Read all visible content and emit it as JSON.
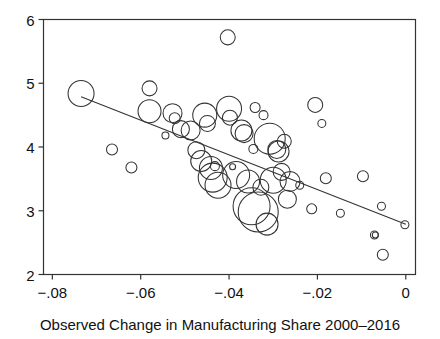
{
  "chart_data": {
    "type": "scatter",
    "title": "",
    "subtitle": "",
    "xlabel": "Observed Change in Manufacturing Share 2000–2016",
    "ylabel": "",
    "xlim": [
      -0.082,
      0.0022
    ],
    "ylim": [
      2.0,
      6.0
    ],
    "grid": false,
    "legend": "none",
    "marker_style": "open-circle-bubble",
    "marker_fill": "none",
    "marker_stroke": "#333333",
    "axis_color": "#333333",
    "background": "#ffffff",
    "xticks": [
      -0.08,
      -0.06,
      -0.04,
      -0.02,
      0
    ],
    "xticklabels": [
      "−.08",
      "−.06",
      "−.04",
      "−.02",
      "0"
    ],
    "yticks": [
      2,
      3,
      4,
      5,
      6
    ],
    "yticklabels": [
      "2",
      "3",
      "4",
      "5",
      "6"
    ],
    "size_encoding": "bubble area proportional to weight",
    "fit_line": {
      "type": "linear",
      "x_start": -0.0735,
      "y_start": 4.79,
      "x_end": 0.0,
      "y_end": 2.79,
      "slope": -27.21,
      "intercept": 2.79,
      "color": "#333333"
    },
    "points": [
      {
        "x": -0.0735,
        "y": 4.84,
        "size": 13.0
      },
      {
        "x": -0.0665,
        "y": 3.96,
        "size": 5.5
      },
      {
        "x": -0.0621,
        "y": 3.68,
        "size": 5.5
      },
      {
        "x": -0.058,
        "y": 4.92,
        "size": 7.5
      },
      {
        "x": -0.058,
        "y": 4.56,
        "size": 11.5
      },
      {
        "x": -0.0544,
        "y": 4.18,
        "size": 3.5
      },
      {
        "x": -0.0528,
        "y": 4.53,
        "size": 9.5
      },
      {
        "x": -0.0523,
        "y": 4.45,
        "size": 5.5
      },
      {
        "x": -0.0509,
        "y": 4.28,
        "size": 8.5
      },
      {
        "x": -0.0487,
        "y": 4.26,
        "size": 9.5
      },
      {
        "x": -0.0474,
        "y": 3.95,
        "size": 8.5
      },
      {
        "x": -0.0463,
        "y": 3.78,
        "size": 10.5
      },
      {
        "x": -0.0455,
        "y": 4.5,
        "size": 12.0
      },
      {
        "x": -0.0449,
        "y": 4.37,
        "size": 8.0
      },
      {
        "x": -0.0441,
        "y": 3.67,
        "size": 11.5
      },
      {
        "x": -0.0437,
        "y": 3.52,
        "size": 14.5
      },
      {
        "x": -0.0432,
        "y": 3.7,
        "size": 4.5
      },
      {
        "x": -0.0425,
        "y": 3.4,
        "size": 13.0
      },
      {
        "x": -0.0403,
        "y": 5.72,
        "size": 7.5
      },
      {
        "x": -0.04,
        "y": 4.6,
        "size": 12.5
      },
      {
        "x": -0.0398,
        "y": 4.46,
        "size": 7.5
      },
      {
        "x": -0.0392,
        "y": 3.69,
        "size": 3.0
      },
      {
        "x": -0.0384,
        "y": 3.56,
        "size": 13.5
      },
      {
        "x": -0.0372,
        "y": 4.26,
        "size": 10.5
      },
      {
        "x": -0.0366,
        "y": 4.21,
        "size": 9.0
      },
      {
        "x": -0.0357,
        "y": 3.46,
        "size": 11.5
      },
      {
        "x": -0.0349,
        "y": 3.07,
        "size": 18.5
      },
      {
        "x": -0.0345,
        "y": 3.97,
        "size": 4.5
      },
      {
        "x": -0.0341,
        "y": 4.62,
        "size": 5.0
      },
      {
        "x": -0.0334,
        "y": 2.98,
        "size": 20.0
      },
      {
        "x": -0.0328,
        "y": 3.37,
        "size": 8.0
      },
      {
        "x": -0.0322,
        "y": 4.5,
        "size": 4.5
      },
      {
        "x": -0.0314,
        "y": 2.79,
        "size": 11.0
      },
      {
        "x": -0.0308,
        "y": 4.13,
        "size": 15.5
      },
      {
        "x": -0.03,
        "y": 3.48,
        "size": 13.0
      },
      {
        "x": -0.0292,
        "y": 3.96,
        "size": 9.0
      },
      {
        "x": -0.0288,
        "y": 3.93,
        "size": 10.5
      },
      {
        "x": -0.0281,
        "y": 3.61,
        "size": 8.5
      },
      {
        "x": -0.0275,
        "y": 4.09,
        "size": 7.0
      },
      {
        "x": -0.0268,
        "y": 3.18,
        "size": 9.0
      },
      {
        "x": -0.0262,
        "y": 3.46,
        "size": 10.0
      },
      {
        "x": -0.024,
        "y": 3.4,
        "size": 4.0
      },
      {
        "x": -0.0213,
        "y": 3.03,
        "size": 5.0
      },
      {
        "x": -0.0205,
        "y": 4.66,
        "size": 7.5
      },
      {
        "x": -0.019,
        "y": 4.37,
        "size": 4.0
      },
      {
        "x": -0.0181,
        "y": 3.51,
        "size": 5.5
      },
      {
        "x": -0.0148,
        "y": 2.96,
        "size": 4.0
      },
      {
        "x": -0.0097,
        "y": 3.54,
        "size": 5.5
      },
      {
        "x": -0.0071,
        "y": 2.62,
        "size": 4.0
      },
      {
        "x": -0.0069,
        "y": 2.62,
        "size": 3.0
      },
      {
        "x": -0.0055,
        "y": 3.07,
        "size": 4.0
      },
      {
        "x": -0.0052,
        "y": 2.31,
        "size": 5.5
      },
      {
        "x": -0.0002,
        "y": 2.78,
        "size": 4.0
      }
    ]
  },
  "axis": {
    "xlabel": "Observed Change in Manufacturing Share 2000–2016"
  }
}
